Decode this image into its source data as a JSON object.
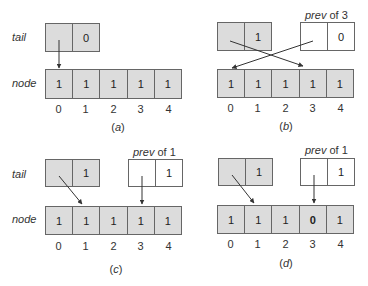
{
  "labels": {
    "tail": "tail",
    "node": "node",
    "prev_word": "prev",
    "of_word": " of "
  },
  "indices": [
    "0",
    "1",
    "2",
    "3",
    "4"
  ],
  "panels": {
    "a": {
      "caption": "a",
      "tail": {
        "left": "",
        "right": "0"
      },
      "node": [
        "1",
        "1",
        "1",
        "1",
        "1"
      ]
    },
    "b": {
      "caption": "b",
      "tail": {
        "left": "",
        "right": "1"
      },
      "prev": {
        "of": "3",
        "left": "",
        "right": "0"
      },
      "node": [
        "1",
        "1",
        "1",
        "1",
        "1"
      ]
    },
    "c": {
      "caption": "c",
      "tail": {
        "left": "",
        "right": "1"
      },
      "prev": {
        "of": "1",
        "left": "",
        "right": "1"
      },
      "node": [
        "1",
        "1",
        "1",
        "1",
        "1"
      ]
    },
    "d": {
      "caption": "d",
      "tail": {
        "left": "",
        "right": "1"
      },
      "prev": {
        "of": "1",
        "left": "",
        "right": "1"
      },
      "node": [
        "1",
        "1",
        "1",
        "0",
        "1"
      ]
    }
  },
  "colors": {
    "cell_fill": "#dcdcdc",
    "border": "#666666",
    "arrow": "#333333"
  }
}
